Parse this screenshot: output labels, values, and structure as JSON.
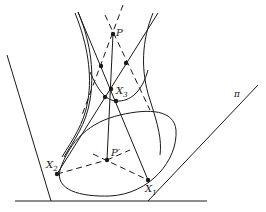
{
  "figure": {
    "stroke_color": "#1a1a1a",
    "background": "#ffffff"
  },
  "labels": {
    "P": {
      "text": "P",
      "x": 116,
      "y": 28
    },
    "P_prime": {
      "text": "P′",
      "x": 111,
      "y": 148
    },
    "X1": {
      "main": "X",
      "sub": "1",
      "x": 145,
      "y": 184
    },
    "X2": {
      "main": "X",
      "sub": "2",
      "x": 46,
      "y": 160
    },
    "X3": {
      "main": "X",
      "sub": "3",
      "x": 116,
      "y": 86
    },
    "pi": {
      "text": "π",
      "x": 234,
      "y": 90
    }
  },
  "points": [
    {
      "name": "P",
      "x": 113,
      "y": 34
    },
    {
      "name": "X3",
      "x": 111,
      "y": 89
    },
    {
      "name": "P_prime",
      "x": 107,
      "y": 160
    },
    {
      "name": "X2",
      "x": 57,
      "y": 174
    },
    {
      "name": "X1",
      "x": 148,
      "y": 180
    },
    {
      "name": "generator-left-upper",
      "x": 101,
      "y": 66
    },
    {
      "name": "generator-right-upper",
      "x": 126,
      "y": 63
    },
    {
      "name": "generator-left-lower",
      "x": 105,
      "y": 97
    },
    {
      "name": "generator-right-lower",
      "x": 116,
      "y": 101
    }
  ]
}
